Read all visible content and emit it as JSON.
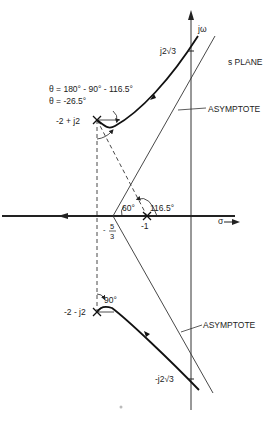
{
  "diagram": {
    "type": "root-locus",
    "plane_label": "s PLANE",
    "axes": {
      "imaginary_label": "jω",
      "real_label": "σ"
    },
    "poles": [
      {
        "label": "-2 + j2",
        "re": -2,
        "im": 2
      },
      {
        "label": "-2 - j2",
        "re": -2,
        "im": -2
      },
      {
        "label": "-1",
        "re": -1,
        "im": 0
      }
    ],
    "centroid": {
      "label_num": "5",
      "label_den": "3",
      "label_sign": "-",
      "value": -1.667
    },
    "crossings": [
      {
        "label": "j2√3",
        "im": 3.464
      },
      {
        "label": "-j2√3",
        "im": -3.464
      }
    ],
    "angles": {
      "departure_formula": "θ = 180° - 90° - 116.5°",
      "departure_result": "θ = -26.5°",
      "asymptote_angle": "60°",
      "pole_angle": "116.5°",
      "lower_angle": "90°"
    },
    "asymptote_labels": [
      "ASYMPTOTE",
      "ASYMPTOTE"
    ]
  }
}
